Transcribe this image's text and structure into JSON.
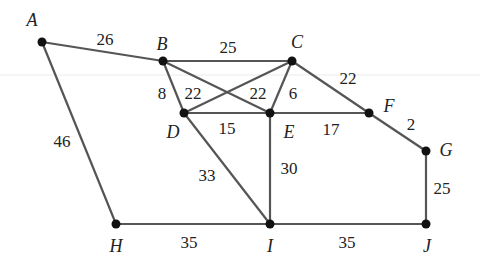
{
  "diagram": {
    "type": "weighted-graph",
    "colors": {
      "edge": "#555555",
      "node": "#111111",
      "text": "#222222",
      "faint_line": "#e6e6e6"
    },
    "nodes": [
      {
        "id": "A",
        "x": 42,
        "y": 42,
        "lx": 32,
        "ly": 20
      },
      {
        "id": "B",
        "x": 163,
        "y": 61,
        "lx": 162,
        "ly": 44
      },
      {
        "id": "C",
        "x": 292,
        "y": 61,
        "lx": 297,
        "ly": 42
      },
      {
        "id": "D",
        "x": 184,
        "y": 113,
        "lx": 173,
        "ly": 132
      },
      {
        "id": "E",
        "x": 270,
        "y": 113,
        "lx": 289,
        "ly": 132
      },
      {
        "id": "F",
        "x": 369,
        "y": 113,
        "lx": 389,
        "ly": 106
      },
      {
        "id": "G",
        "x": 426,
        "y": 151,
        "lx": 446,
        "ly": 150
      },
      {
        "id": "H",
        "x": 116,
        "y": 224,
        "lx": 116,
        "ly": 246
      },
      {
        "id": "I",
        "x": 270,
        "y": 224,
        "lx": 270,
        "ly": 246
      },
      {
        "id": "J",
        "x": 426,
        "y": 224,
        "lx": 427,
        "ly": 246
      }
    ],
    "edges": [
      {
        "from": "A",
        "to": "B",
        "weight": "26",
        "lx": 105,
        "ly": 39
      },
      {
        "from": "A",
        "to": "H",
        "weight": "46",
        "lx": 62,
        "ly": 141
      },
      {
        "from": "B",
        "to": "C",
        "weight": "25",
        "lx": 228,
        "ly": 47
      },
      {
        "from": "B",
        "to": "D",
        "weight": "8",
        "lx": 162,
        "ly": 93
      },
      {
        "from": "B",
        "to": "E",
        "weight": "22",
        "lx": 193,
        "ly": 93
      },
      {
        "from": "C",
        "to": "D",
        "weight": "22",
        "lx": 258,
        "ly": 93
      },
      {
        "from": "C",
        "to": "E",
        "weight": "6",
        "lx": 293,
        "ly": 93
      },
      {
        "from": "C",
        "to": "F",
        "weight": "22",
        "lx": 348,
        "ly": 78
      },
      {
        "from": "D",
        "to": "E",
        "weight": "15",
        "lx": 227,
        "ly": 128
      },
      {
        "from": "E",
        "to": "F",
        "weight": "17",
        "lx": 331,
        "ly": 129
      },
      {
        "from": "F",
        "to": "G",
        "weight": "2",
        "lx": 411,
        "ly": 124
      },
      {
        "from": "D",
        "to": "I",
        "weight": "33",
        "lx": 207,
        "ly": 175
      },
      {
        "from": "E",
        "to": "I",
        "weight": "30",
        "lx": 289,
        "ly": 168
      },
      {
        "from": "G",
        "to": "J",
        "weight": "25",
        "lx": 442,
        "ly": 188
      },
      {
        "from": "H",
        "to": "I",
        "weight": "35",
        "lx": 189,
        "ly": 242
      },
      {
        "from": "I",
        "to": "J",
        "weight": "35",
        "lx": 347,
        "ly": 242
      }
    ]
  }
}
